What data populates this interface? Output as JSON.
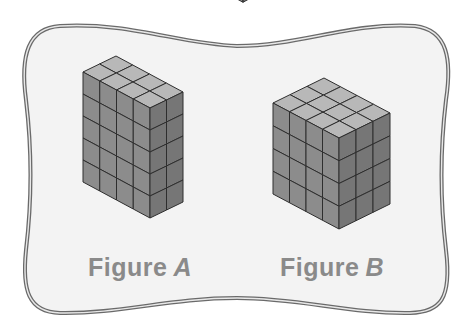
{
  "diagram": {
    "background": "#ffffff",
    "frame": {
      "fill": "#f3f3f3",
      "stroke": "#6a6a6a"
    },
    "colors": {
      "top": "#b8b8b8",
      "left": "#8c8c8c",
      "right": "#767676",
      "edge": "#2e2e2e"
    },
    "partial_cube_top": {
      "x": 232,
      "y": -6,
      "size": 11
    }
  },
  "figures": [
    {
      "id": "A",
      "label": "Figure",
      "variable": "A",
      "label_pos": {
        "x": 88,
        "y": 253
      },
      "cubes": {
        "width_cols": 4,
        "depth_cols": 2,
        "height_layers": 5
      },
      "geometry": {
        "left": [
          83,
          72
        ],
        "front_top": [
          150,
          108
        ],
        "right_top": [
          183,
          92
        ],
        "layer_height": 22
      }
    },
    {
      "id": "B",
      "label": "Figure",
      "variable": "B",
      "label_pos": {
        "x": 280,
        "y": 253
      },
      "cubes": {
        "width_cols": 4,
        "depth_cols": 3,
        "height_layers": 4
      },
      "geometry": {
        "left": [
          273,
          103
        ],
        "front_top": [
          339,
          138
        ],
        "right_top": [
          390,
          113
        ],
        "layer_height": 22.75
      }
    }
  ]
}
